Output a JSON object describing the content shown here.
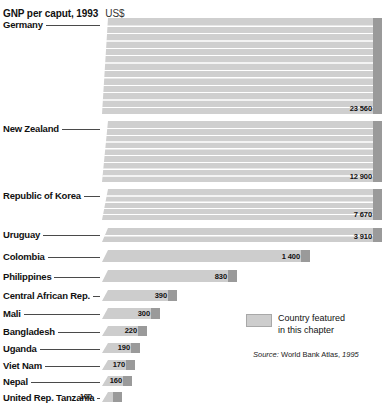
{
  "header": {
    "title": "GNP per caput, 1993",
    "unit": "US$"
  },
  "legend": {
    "swatch_name": "featured-country-swatch",
    "line1": "Country featured",
    "line2": "in this chapter",
    "source_lead": "Source:",
    "source_text": "World Bank Atlas,",
    "source_year": "1995"
  },
  "colors": {
    "bar_face": "#cdcdcd",
    "bar_cap": "#9a9a9a",
    "bar_shadow": "#8d8d8d",
    "stripe": "#ffffff",
    "text": "#111111",
    "leader": "#4a4a4a",
    "background": "#ffffff"
  },
  "chart_data": {
    "type": "bar",
    "orientation": "horizontal",
    "title": "GNP per caput, 1993",
    "xlabel": "US$",
    "ylabel": "",
    "grid": false,
    "legend_position": "bottom-right",
    "value_unit": "US$",
    "categories": [
      "Germany",
      "New Zealand",
      "Republic of Korea",
      "Uruguay",
      "Colombia",
      "Philippines",
      "Central African Rep.",
      "Mali",
      "Bangladesh",
      "Uganda",
      "Viet Nam",
      "Nepal",
      "United Rep. Tanzania"
    ],
    "values": [
      23560,
      12900,
      7670,
      3910,
      1400,
      830,
      390,
      300,
      220,
      190,
      170,
      160,
      100
    ],
    "value_labels": [
      "23 560",
      "12 900",
      "7 670",
      "3 910",
      "1 400",
      "830",
      "390",
      "300",
      "220",
      "190",
      "170",
      "160",
      "100"
    ],
    "featured": [
      "Uruguay"
    ],
    "xlim": [
      0,
      23560
    ],
    "series": [
      {
        "name": "GNP per caput 1993 (US$)",
        "values": [
          23560,
          12900,
          7670,
          3910,
          1400,
          830,
          390,
          300,
          220,
          190,
          170,
          160,
          100
        ]
      }
    ]
  },
  "bars": [
    {
      "label": "Germany",
      "value_label": "23 560",
      "top": 2,
      "height": 96,
      "bar_len": 280,
      "stripes": 12,
      "label_y": 4,
      "val_inside": true
    },
    {
      "label": "New Zealand",
      "value_label": "12 900",
      "top": 105,
      "height": 61,
      "bar_len": 280,
      "stripes": 8,
      "label_y": 108,
      "val_inside": true
    },
    {
      "label": "Republic of Korea",
      "value_label": "7 670",
      "top": 173,
      "height": 31,
      "bar_len": 280,
      "stripes": 4,
      "label_y": 175,
      "val_inside": true
    },
    {
      "label": "Uruguay",
      "value_label": "3 910",
      "top": 212,
      "height": 14,
      "bar_len": 280,
      "stripes": 1,
      "label_y": 214,
      "val_inside": true
    },
    {
      "label": "Colombia",
      "value_label": "1 400",
      "top": 234,
      "height": 12,
      "bar_len": 208,
      "stripes": 0,
      "label_y": 236,
      "val_inside": true
    },
    {
      "label": "Philippines",
      "value_label": "830",
      "top": 254,
      "height": 12,
      "bar_len": 135,
      "stripes": 0,
      "label_y": 256,
      "val_inside": true
    },
    {
      "label": "Central African Rep.",
      "value_label": "390",
      "top": 274,
      "height": 11,
      "bar_len": 75,
      "stripes": 0,
      "label_y": 275,
      "val_inside": true
    },
    {
      "label": "Mali",
      "value_label": "300",
      "top": 292,
      "height": 11,
      "bar_len": 58,
      "stripes": 0,
      "label_y": 293,
      "val_inside": true
    },
    {
      "label": "Bangladesh",
      "value_label": "220",
      "top": 310,
      "height": 10,
      "bar_len": 45,
      "stripes": 0,
      "label_y": 311,
      "val_inside": true
    },
    {
      "label": "Uganda",
      "value_label": "190",
      "top": 327,
      "height": 10,
      "bar_len": 38,
      "stripes": 0,
      "label_y": 328,
      "val_inside": true
    },
    {
      "label": "Viet Nam",
      "value_label": "170",
      "top": 344,
      "height": 10,
      "bar_len": 33,
      "stripes": 0,
      "label_y": 345,
      "val_inside": true
    },
    {
      "label": "Nepal",
      "value_label": "160",
      "top": 360,
      "height": 10,
      "bar_len": 30,
      "stripes": 0,
      "label_y": 361,
      "val_inside": true
    },
    {
      "label": "United Rep. Tanzania",
      "value_label": "100",
      "top": 376,
      "height": 10,
      "bar_len": 20,
      "stripes": 0,
      "label_y": 377,
      "val_inside": false
    }
  ]
}
